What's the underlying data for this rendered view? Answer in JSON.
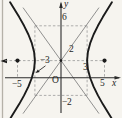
{
  "figure": {
    "labels": {
      "y_axis": "y",
      "x_axis": "x",
      "origin": "O",
      "y_6": "6",
      "y_2": "2",
      "y_neg2": "−2",
      "x_neg5": "−5",
      "x_neg3": "−3",
      "x_3": "3",
      "x_5": "5"
    },
    "figure_data": {
      "type": "hyperbola-graph",
      "curve": "hyperbola with horizontal transverse axis",
      "center": [
        0,
        2
      ],
      "vertices": [
        [
          -3,
          2
        ],
        [
          3,
          2
        ]
      ],
      "marked_dots": [
        [
          -5,
          2
        ],
        [
          5,
          2
        ],
        [
          0,
          2
        ]
      ],
      "asymptote_box": {
        "x_range": [
          -3,
          3
        ],
        "y_range": [
          -2,
          6
        ]
      },
      "asymptotes": "diagonals through (0,2) and box corners",
      "x_tick_labels": [
        "−5",
        "−3",
        "3",
        "5"
      ],
      "y_tick_labels": [
        "−2",
        "2",
        "6"
      ],
      "styles": {
        "background": "#f6f4ef",
        "curve_color": "#1b1b1b",
        "axis_color": "#2b2b2b",
        "asymptote_color": "#767676",
        "dashed_color": "#949494",
        "scan_border_color": "#b5b1a8"
      }
    }
  }
}
